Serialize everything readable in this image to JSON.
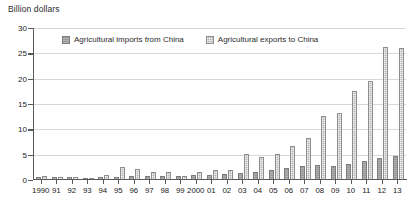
{
  "chart_data": {
    "type": "bar",
    "title": "Billion dollars",
    "xlabel": "",
    "ylabel": "Billion dollars",
    "ylim": [
      0,
      30
    ],
    "ytick_values": [
      0,
      5,
      10,
      15,
      20,
      25,
      30
    ],
    "ytick_labels": [
      "0",
      "5",
      "10",
      "15",
      "20",
      "25",
      "30"
    ],
    "grid": true,
    "legend_position": "top-left-inside",
    "categories": [
      "1990",
      "91",
      "92",
      "93",
      "94",
      "95",
      "96",
      "97",
      "98",
      "99",
      "2000",
      "01",
      "02",
      "03",
      "04",
      "05",
      "06",
      "07",
      "08",
      "09",
      "10",
      "11",
      "12",
      "13"
    ],
    "series": [
      {
        "name": "Agricultural imports from China",
        "color": "#9a9a9a",
        "values": [
          0.5,
          0.5,
          0.5,
          0.4,
          0.5,
          0.6,
          0.7,
          0.7,
          0.8,
          0.8,
          0.9,
          1.0,
          1.2,
          1.4,
          1.6,
          1.9,
          2.3,
          2.7,
          3.0,
          2.8,
          3.2,
          3.7,
          4.4,
          4.7
        ]
      },
      {
        "name": "Agricultural exports to China",
        "color": "#b4b4b4",
        "values": [
          0.8,
          0.6,
          0.5,
          0.4,
          1.0,
          2.6,
          2.1,
          1.6,
          1.5,
          0.8,
          1.6,
          1.9,
          1.9,
          5.2,
          4.6,
          5.2,
          6.7,
          8.3,
          12.6,
          13.2,
          17.5,
          19.5,
          26.3,
          26.0
        ]
      }
    ]
  }
}
